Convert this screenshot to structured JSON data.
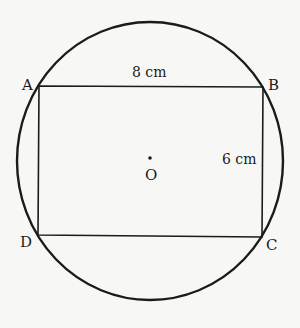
{
  "figure": {
    "stroke_color": "#1b1b1b",
    "background": "#f7f7f5",
    "circle": {
      "cx": 150,
      "cy": 161,
      "rx": 133,
      "ry": 139,
      "stroke_width": 2.4
    },
    "rectangle": {
      "points": "39,86 263,87 262,237 38,235",
      "stroke_width": 1.6
    },
    "center_dot": {
      "cx": 150,
      "cy": 158,
      "r": 1.8
    },
    "vertices": [
      {
        "name": "A",
        "x": 22,
        "y": 78
      },
      {
        "name": "B",
        "x": 268,
        "y": 78
      },
      {
        "name": "C",
        "x": 266,
        "y": 238
      },
      {
        "name": "D",
        "x": 20,
        "y": 235
      }
    ],
    "center_label": {
      "name": "O",
      "x": 145,
      "y": 168
    },
    "measurements": {
      "length": {
        "text": "8 cm",
        "x": 132,
        "y": 65
      },
      "width": {
        "text": "6 cm",
        "x": 222,
        "y": 152
      }
    }
  }
}
